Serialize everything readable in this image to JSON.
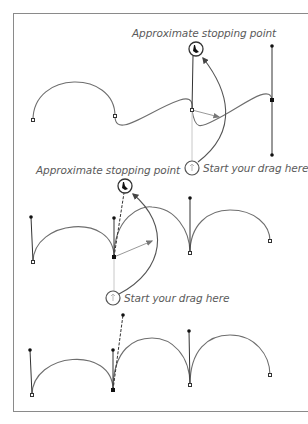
{
  "figure": {
    "panels": [
      {
        "id": "top",
        "stop_label": "Approximate stopping point",
        "start_label": "Start your drag here",
        "stop_icon": "pen-cursor-icon",
        "start_icon": "pen-cursor-start-icon"
      },
      {
        "id": "middle",
        "stop_label": "Approximate stopping point",
        "start_label": "Start your drag here",
        "stop_icon": "pen-cursor-icon",
        "start_icon": "pen-cursor-start-icon"
      },
      {
        "id": "bottom",
        "description": "Resulting path with adjusted handle"
      }
    ]
  },
  "colors": {
    "frame": "#8a8a8a",
    "curve": "#6e6e6e",
    "handle": "#333333",
    "text": "#5a5a5a",
    "ghost": "#c8c8c8"
  }
}
